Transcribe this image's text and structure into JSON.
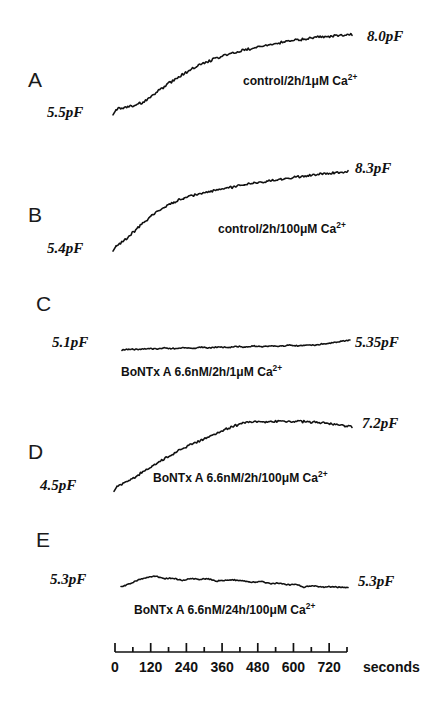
{
  "figure": {
    "width": 447,
    "height": 705,
    "background": "#ffffff",
    "ink_color": "#111111"
  },
  "chart_data": {
    "type": "line",
    "title": "",
    "xlabel": "seconds",
    "ylabel": "membrane capacitance (pF)",
    "xlim": [
      0,
      780
    ],
    "grid": false,
    "legend_position": "inline-annotation",
    "axis": {
      "unit_label": "seconds",
      "major_ticks": [
        0,
        120,
        240,
        360,
        480,
        600,
        720
      ],
      "major_tick_labels": [
        "0",
        "120",
        "240",
        "360",
        "480",
        "600",
        "720"
      ],
      "minor_ticks": [
        60,
        180,
        300,
        420,
        540,
        660,
        780
      ],
      "minor_interval": 60,
      "shared_for_panels": [
        "A",
        "B",
        "C",
        "D",
        "E"
      ]
    },
    "series": [
      {
        "panel": "A",
        "name": "control/2h/1uM Ca2+",
        "annotation": "control/2h/1",
        "annotation_mu": "μM Ca",
        "annotation_sup": "2+",
        "start_label": "5.5pF",
        "end_label": "8.0pF",
        "start_value": 5.5,
        "end_value": 8.0,
        "x": [
          0,
          30,
          60,
          90,
          120,
          150,
          180,
          210,
          240,
          270,
          300,
          330,
          360,
          390,
          420,
          450,
          480,
          510,
          540,
          570,
          600,
          630,
          660,
          690,
          720,
          750,
          780
        ],
        "values": [
          5.5,
          5.55,
          5.62,
          5.72,
          5.95,
          6.18,
          6.4,
          6.6,
          6.78,
          6.95,
          7.08,
          7.2,
          7.3,
          7.38,
          7.46,
          7.53,
          7.6,
          7.66,
          7.72,
          7.77,
          7.82,
          7.86,
          7.9,
          7.93,
          7.96,
          7.98,
          8.0
        ]
      },
      {
        "panel": "B",
        "name": "control/2h/100uM Ca2+",
        "annotation": "control/2h/100",
        "annotation_mu": "μM Ca",
        "annotation_sup": "2+",
        "start_label": "5.4pF",
        "end_label": "8.3pF",
        "start_value": 5.4,
        "end_value": 8.3,
        "x": [
          0,
          30,
          60,
          90,
          120,
          150,
          180,
          210,
          240,
          270,
          300,
          330,
          360,
          390,
          420,
          450,
          480,
          510,
          540,
          570,
          600,
          630,
          660,
          690,
          720,
          750,
          780
        ],
        "values": [
          5.4,
          5.62,
          5.95,
          6.28,
          6.58,
          6.82,
          7.02,
          7.18,
          7.3,
          7.4,
          7.49,
          7.57,
          7.64,
          7.7,
          7.76,
          7.82,
          7.88,
          7.93,
          7.98,
          8.03,
          8.08,
          8.13,
          8.18,
          8.22,
          8.25,
          8.28,
          8.3
        ]
      },
      {
        "panel": "C",
        "name": "BoNTx A 6.6nM/2h/1uM Ca2+",
        "annotation": "BoNTx A 6.6nM/2h/1",
        "annotation_mu": "μM Ca",
        "annotation_sup": "2+",
        "start_label": "5.1pF",
        "end_label": "5.35pF",
        "start_value": 5.1,
        "end_value": 5.35,
        "x": [
          0,
          30,
          60,
          90,
          120,
          150,
          180,
          210,
          240,
          270,
          300,
          330,
          360,
          390,
          420,
          450,
          480,
          510,
          540,
          570,
          600,
          630,
          660,
          690,
          720,
          750,
          780
        ],
        "values": [
          5.1,
          5.12,
          5.11,
          5.14,
          5.12,
          5.15,
          5.13,
          5.16,
          5.14,
          5.17,
          5.15,
          5.18,
          5.16,
          5.19,
          5.17,
          5.2,
          5.18,
          5.21,
          5.19,
          5.22,
          5.2,
          5.23,
          5.22,
          5.26,
          5.28,
          5.32,
          5.35
        ]
      },
      {
        "panel": "D",
        "name": "BoNTx A 6.6nM/2h/100uM Ca2+",
        "annotation": "BoNTx A 6.6nM/2h/100",
        "annotation_mu": "μM Ca",
        "annotation_sup": "2+",
        "start_label": "4.5pF",
        "end_label": "7.2pF",
        "start_value": 4.5,
        "end_value": 7.2,
        "peak_value": 7.45,
        "x": [
          0,
          30,
          60,
          90,
          120,
          150,
          180,
          210,
          240,
          270,
          300,
          330,
          360,
          390,
          420,
          450,
          480,
          510,
          540,
          570,
          600,
          630,
          660,
          690,
          720,
          750,
          780
        ],
        "values": [
          4.5,
          4.72,
          4.95,
          5.2,
          5.45,
          5.7,
          5.95,
          6.18,
          6.38,
          6.55,
          6.72,
          6.9,
          7.08,
          7.25,
          7.38,
          7.42,
          7.44,
          7.43,
          7.45,
          7.44,
          7.45,
          7.43,
          7.4,
          7.37,
          7.33,
          7.27,
          7.2
        ]
      },
      {
        "panel": "E",
        "name": "BoNTx A 6.6nM/24h/100uM Ca2+",
        "annotation": "BoNTx A 6.6nM/24h/100",
        "annotation_mu": "μM Ca",
        "annotation_sup": "2+",
        "start_label": "5.3pF",
        "end_label": "5.3pF",
        "start_value": 5.3,
        "end_value": 5.3,
        "x": [
          0,
          30,
          60,
          90,
          120,
          150,
          180,
          210,
          240,
          270,
          300,
          330,
          360,
          390,
          420,
          450,
          480,
          510,
          540,
          570,
          600,
          630,
          660,
          690,
          720,
          750,
          780
        ],
        "values": [
          5.3,
          5.36,
          5.42,
          5.46,
          5.48,
          5.44,
          5.45,
          5.41,
          5.44,
          5.43,
          5.44,
          5.4,
          5.41,
          5.42,
          5.4,
          5.38,
          5.39,
          5.36,
          5.37,
          5.34,
          5.35,
          5.3,
          5.33,
          5.3,
          5.31,
          5.3,
          5.3
        ]
      }
    ]
  },
  "panels": [
    {
      "id": "A",
      "letter": "A",
      "letter_x": 28,
      "letter_y": 68,
      "start_label_x": 47,
      "start_label_y": 104,
      "end_label_x": 367,
      "end_label_y": 28,
      "cond_x": 243,
      "cond_y": 73,
      "trace_top": 30,
      "trace_height": 85,
      "trace_x0": 116,
      "trace_x1": 352,
      "y_min": 5.3,
      "y_max": 8.15
    },
    {
      "id": "B",
      "letter": "B",
      "letter_x": 28,
      "letter_y": 203,
      "start_label_x": 47,
      "start_label_y": 240,
      "end_label_x": 355,
      "end_label_y": 160,
      "cond_x": 218,
      "cond_y": 221,
      "trace_top": 168,
      "trace_height": 80,
      "trace_x0": 116,
      "trace_x1": 348,
      "y_min": 5.3,
      "y_max": 8.45
    },
    {
      "id": "C",
      "letter": "C",
      "letter_x": 36,
      "letter_y": 292,
      "start_label_x": 52,
      "start_label_y": 334,
      "end_label_x": 355,
      "end_label_y": 334,
      "cond_x": 121,
      "cond_y": 364,
      "trace_top": 336,
      "trace_height": 18,
      "trace_x0": 122,
      "trace_x1": 350,
      "y_min": 5.0,
      "y_max": 5.45
    },
    {
      "id": "D",
      "letter": "D",
      "letter_x": 28,
      "letter_y": 440,
      "start_label_x": 40,
      "start_label_y": 477,
      "end_label_x": 362,
      "end_label_y": 415,
      "cond_x": 153,
      "cond_y": 470,
      "trace_top": 418,
      "trace_height": 72,
      "trace_x0": 117,
      "trace_x1": 352,
      "y_min": 4.35,
      "y_max": 7.6
    },
    {
      "id": "E",
      "letter": "E",
      "letter_x": 36,
      "letter_y": 528,
      "start_label_x": 50,
      "start_label_y": 571,
      "end_label_x": 358,
      "end_label_y": 573,
      "cond_x": 134,
      "cond_y": 602,
      "trace_top": 572,
      "trace_height": 20,
      "trace_x0": 121,
      "trace_x1": 348,
      "y_min": 5.22,
      "y_max": 5.55
    }
  ],
  "axis_layout": {
    "x0": 115,
    "x1": 347,
    "y": 652,
    "tick_len_major": 9,
    "tick_len_minor": 5,
    "label_y": 659,
    "unit_x": 363,
    "unit_y": 659
  }
}
